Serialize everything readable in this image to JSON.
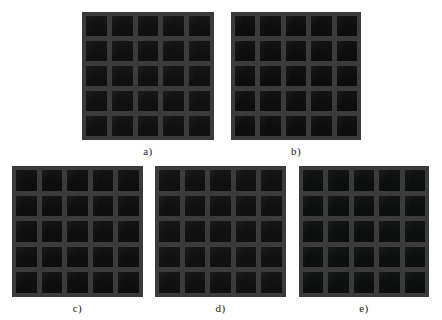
{
  "figure": {
    "background_color": "#ffffff",
    "panel_count": 5,
    "layout": "2 panels top row, 3 panels bottom row",
    "substrate_color": "#3b3b3b",
    "cell_color": "#0e0e0e"
  },
  "panels": [
    {
      "id": "a",
      "caption": "a)",
      "rows": 5,
      "cols": 5,
      "cell_count": 25,
      "substrate_color": "#3b3b3b",
      "cell_color": "#101010"
    },
    {
      "id": "b",
      "caption": "b)",
      "rows": 5,
      "cols": 5,
      "cell_count": 25,
      "substrate_color": "#3b3b3b",
      "cell_color": "#0d0d0d"
    },
    {
      "id": "c",
      "caption": "c)",
      "rows": 5,
      "cols": 5,
      "cell_count": 25,
      "substrate_color": "#3b3b3b",
      "cell_color": "#0e0e0e"
    },
    {
      "id": "d",
      "caption": "d)",
      "rows": 5,
      "cols": 5,
      "cell_count": 25,
      "substrate_color": "#3b3b3b",
      "cell_color": "#101011"
    },
    {
      "id": "e",
      "caption": "e)",
      "rows": 5,
      "cols": 5,
      "cell_count": 25,
      "substrate_color": "#3b3b3b",
      "cell_color": "#0d0e0e"
    }
  ]
}
